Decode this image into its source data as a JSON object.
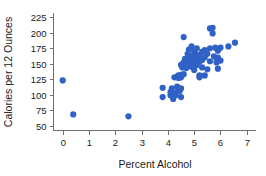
{
  "chart_data": {
    "type": "scatter",
    "title": "",
    "xlabel": "Percent Alcohol",
    "ylabel": "Calories per 12 Ounces",
    "xlim": [
      -0.35,
      7.35
    ],
    "ylim": [
      42,
      232
    ],
    "xticks": [
      0,
      1,
      2,
      3,
      4,
      5,
      6,
      7
    ],
    "yticks": [
      50,
      75,
      100,
      125,
      150,
      175,
      200,
      225
    ],
    "xticklabels": [
      "0",
      "1",
      "2",
      "3",
      "4",
      "5",
      "6",
      "7"
    ],
    "yticklabels": [
      "50",
      "75",
      "100",
      "125",
      "150",
      "175",
      "200",
      "225"
    ],
    "grid": false,
    "legend": null,
    "point_color": "#2f62c4",
    "point_size": 3.1,
    "axis_color": "#6f6f6f",
    "series": [
      {
        "name": "Beers",
        "points": [
          [
            0.0,
            123
          ],
          [
            0.4,
            68
          ],
          [
            2.5,
            65
          ],
          [
            3.8,
            111
          ],
          [
            3.8,
            96
          ],
          [
            4.1,
            104
          ],
          [
            4.1,
            99
          ],
          [
            4.15,
            110
          ],
          [
            4.2,
            96
          ],
          [
            4.2,
            93
          ],
          [
            4.25,
            128
          ],
          [
            4.3,
            103
          ],
          [
            4.3,
            99
          ],
          [
            4.35,
            129
          ],
          [
            4.35,
            113
          ],
          [
            4.4,
            131
          ],
          [
            4.4,
            127
          ],
          [
            4.4,
            110
          ],
          [
            4.45,
            128
          ],
          [
            4.45,
            106
          ],
          [
            4.5,
            148
          ],
          [
            4.5,
            132
          ],
          [
            4.5,
            128
          ],
          [
            4.5,
            110
          ],
          [
            4.5,
            96
          ],
          [
            4.55,
            144
          ],
          [
            4.6,
            193
          ],
          [
            4.6,
            152
          ],
          [
            4.6,
            146
          ],
          [
            4.6,
            133
          ],
          [
            4.65,
            158
          ],
          [
            4.7,
            153
          ],
          [
            4.7,
            149
          ],
          [
            4.7,
            143
          ],
          [
            4.75,
            166
          ],
          [
            4.8,
            173
          ],
          [
            4.8,
            156
          ],
          [
            4.8,
            152
          ],
          [
            4.8,
            147
          ],
          [
            4.85,
            161
          ],
          [
            4.85,
            150
          ],
          [
            4.9,
            178
          ],
          [
            4.9,
            163
          ],
          [
            4.9,
            155
          ],
          [
            4.9,
            151
          ],
          [
            4.9,
            145
          ],
          [
            4.95,
            159
          ],
          [
            5.0,
            170
          ],
          [
            5.0,
            162
          ],
          [
            5.0,
            157
          ],
          [
            5.0,
            153
          ],
          [
            5.0,
            149
          ],
          [
            5.0,
            140
          ],
          [
            5.05,
            166
          ],
          [
            5.1,
            175
          ],
          [
            5.1,
            160
          ],
          [
            5.1,
            155
          ],
          [
            5.1,
            148
          ],
          [
            5.15,
            158
          ],
          [
            5.2,
            164
          ],
          [
            5.2,
            153
          ],
          [
            5.2,
            131
          ],
          [
            5.2,
            128
          ],
          [
            5.3,
            169
          ],
          [
            5.3,
            156
          ],
          [
            5.3,
            144
          ],
          [
            5.4,
            172
          ],
          [
            5.4,
            160
          ],
          [
            5.4,
            131
          ],
          [
            5.5,
            166
          ],
          [
            5.5,
            141
          ],
          [
            5.6,
            207
          ],
          [
            5.6,
            175
          ],
          [
            5.6,
            154
          ],
          [
            5.7,
            208
          ],
          [
            5.7,
            199
          ],
          [
            5.75,
            162
          ],
          [
            5.8,
            176
          ],
          [
            5.85,
            158
          ],
          [
            5.85,
            152
          ],
          [
            5.9,
            173
          ],
          [
            5.9,
            171
          ],
          [
            5.9,
            160
          ],
          [
            5.9,
            142
          ],
          [
            6.0,
            176
          ],
          [
            6.0,
            155
          ],
          [
            6.3,
            178
          ],
          [
            6.55,
            184
          ]
        ]
      }
    ]
  }
}
